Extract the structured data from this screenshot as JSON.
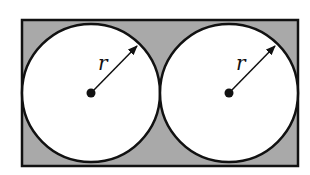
{
  "diagram": {
    "type": "geometry",
    "colors": {
      "shaded": "#a9a9a9",
      "stroke": "#111111",
      "circle_fill": "#ffffff"
    },
    "rectangle": {
      "x": 22,
      "y": 20,
      "width": 276,
      "height": 146
    },
    "circles": [
      {
        "id": "left",
        "cx": 91,
        "cy": 93,
        "r": 69,
        "radius_label": "r"
      },
      {
        "id": "right",
        "cx": 229,
        "cy": 93,
        "r": 69,
        "radius_label": "r"
      }
    ]
  }
}
